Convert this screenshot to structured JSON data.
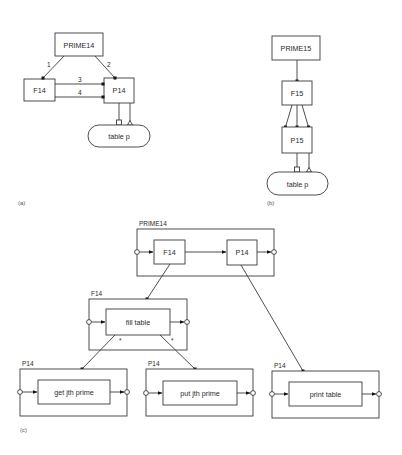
{
  "panel_a": {
    "caption": "(a)",
    "prime_label": "PRIME14",
    "f_label": "F14",
    "p_label": "P14",
    "table_label": "table p",
    "edge_labels": [
      "1",
      "2",
      "3",
      "4"
    ]
  },
  "panel_b": {
    "caption": "(b)",
    "prime_label": "PRIME15",
    "f_label": "F15",
    "p_label": "P15",
    "table_label": "table p"
  },
  "panel_c": {
    "caption": "(c)",
    "top": {
      "outer_label": "PRIME14",
      "left_inner": "F14",
      "right_inner": "P14"
    },
    "fill": {
      "outer_label": "F14",
      "inner": "fill table",
      "iter_marks": [
        "*",
        "*"
      ]
    },
    "get": {
      "outer_label": "P14",
      "inner": "get jth prime"
    },
    "put": {
      "outer_label": "P14",
      "inner": "put jth prime"
    },
    "print": {
      "outer_label": "P14",
      "inner": "print table"
    }
  }
}
